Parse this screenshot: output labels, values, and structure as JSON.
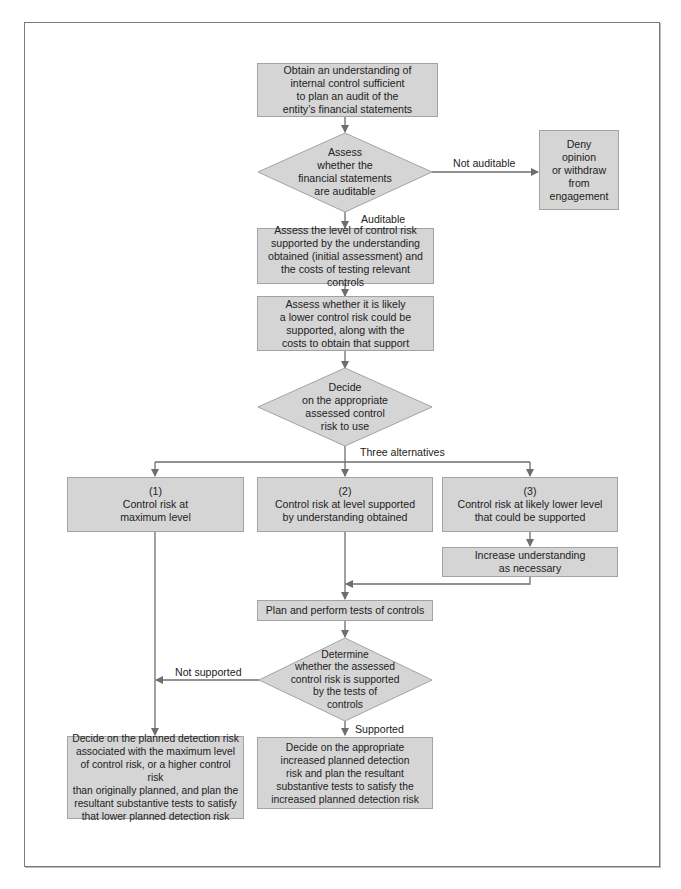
{
  "diagram": {
    "title": "",
    "colors": {
      "box_fill": "#d5d5d5",
      "box_border": "#a3a3a3",
      "line": "#6e6e6e",
      "text": "#222222"
    },
    "nodes": {
      "obtain": "Obtain an understanding of\ninternal control sufficient\nto plan an audit of the\nentity’s financial statements",
      "assess_auditable": "Assess\nwhether the\nfinancial statements\nare auditable",
      "deny": "Deny\nopinion\nor withdraw\nfrom\nengagement",
      "assess_level": "Assess the level of control risk\nsupported by the understanding\nobtained (initial assessment) and\nthe costs of testing relevant controls",
      "assess_lower": "Assess whether it is likely\na lower control risk could be\nsupported, along with the\ncosts to obtain that support",
      "decide_assessed": "Decide\non the appropriate\nassessed control\nrisk to use",
      "alt1": "(1)\nControl risk at\nmaximum level",
      "alt2": "(2)\nControl risk at level supported\nby understanding obtained",
      "alt3": "(3)\nControl risk at likely lower level\nthat could be supported",
      "increase": "Increase understanding\nas necessary",
      "plan_perform": "Plan and perform tests of controls",
      "determine": "Determine\nwhether the assessed\ncontrol risk is supported\nby the tests of\ncontrols",
      "decide_max": "Decide on the planned detection risk\nassociated with the maximum level\nof control risk, or a higher control risk\nthan originally planned, and plan the\nresultant substantive tests to satisfy\nthat lower planned detection risk",
      "decide_increased": "Decide on the appropriate\nincreased planned detection\nrisk and plan the resultant\nsubstantive tests to satisfy the\nincreased planned detection risk"
    },
    "edge_labels": {
      "not_auditable": "Not auditable",
      "auditable": "Auditable",
      "three_alternatives": "Three alternatives",
      "not_supported": "Not supported",
      "supported": "Supported"
    }
  }
}
